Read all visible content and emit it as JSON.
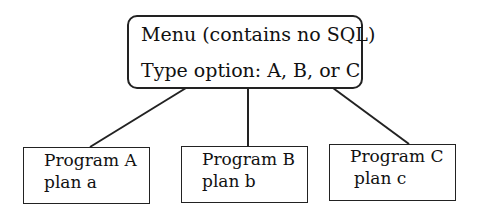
{
  "menu": {
    "line1": "Menu (contains no SQL)",
    "line2": "Type option: A, B, or C"
  },
  "programs": [
    {
      "name": "Program A",
      "plan": "plan a"
    },
    {
      "name": "Program B",
      "plan": "plan b"
    },
    {
      "name": "Program C",
      "plan": "plan c"
    }
  ],
  "colors": {
    "stroke": "#222222",
    "background": "#ffffff"
  }
}
